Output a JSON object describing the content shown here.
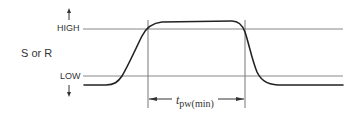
{
  "diagram": {
    "signal_label": "S or R",
    "levels": {
      "high_label": "HIGH",
      "low_label": "LOW"
    },
    "pulse_width": {
      "symbol": "t",
      "subscript": "pw(min)"
    },
    "colors": {
      "waveform": "#222222",
      "reference_lines": "#888888",
      "text": "#333333"
    }
  }
}
